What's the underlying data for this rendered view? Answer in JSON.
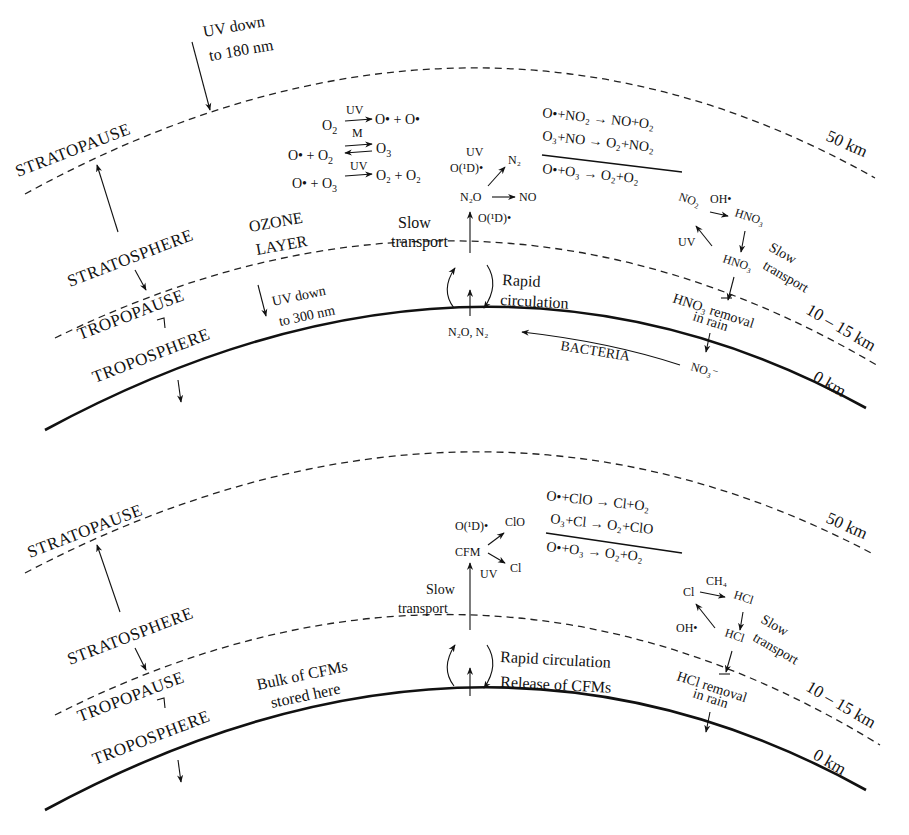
{
  "figure": {
    "panels": [
      {
        "id": "nitrogen-cycle",
        "layers": {
          "stratopause": "STRATOPAUSE",
          "stratosphere": "STRATOSPHERE",
          "tropopause": "TROPOPAUSE",
          "troposphere": "TROPOSPHERE",
          "ozone_layer_1": "OZONE",
          "ozone_layer_2": "LAYER"
        },
        "altitudes": {
          "top": "50 km",
          "mid": "10 – 15 km",
          "ground": "0 km"
        },
        "uv_top_1": "UV down",
        "uv_top_2": "to 180 nm",
        "uv_trop_1": "UV down",
        "uv_trop_2": "to 300 nm",
        "ozone_reactions": {
          "r1_lhs": "O",
          "r1_lhs_sub": "2",
          "r1_cond": "UV",
          "r1_rhs": "O• + O•",
          "r2_cond": "M",
          "r2_lhs": "O• + O",
          "r2_lhs_sub": "2",
          "r2_rhs": "O",
          "r2_rhs_sub": "3",
          "r3_lhs": "O• + O",
          "r3_lhs_sub": "3",
          "r3_cond": "UV",
          "r3_rhs": "O₂ + O₂"
        },
        "n2o_branch": {
          "uv": "UV",
          "o1d_top": "O(¹D)•",
          "n2": "N₂",
          "n2o": "N₂O",
          "no": "NO",
          "o1d_bottom": "O(¹D)•"
        },
        "slow_transport_1": "Slow",
        "slow_transport_2": "transport",
        "rapid_1": "Rapid",
        "rapid_2": "circulation",
        "surface_source": "N₂O, N₂",
        "bacteria": "BACTERIA",
        "nitrate": "NO₃⁻",
        "nox_cycle": {
          "line1": "O•+NO₂ → NO+O₂",
          "line2": "O₃+NO → O₂+NO₂",
          "net": "O•+O₃ → O₂+O₂"
        },
        "sink": {
          "no2": "NO₂",
          "oh": "OH•",
          "hno3_a": "HNO₃",
          "uv": "UV",
          "hno3_b": "HNO₃",
          "slow_1": "Slow",
          "slow_2": "transport",
          "removal_1": "HNO₃ removal",
          "removal_2": "in rain"
        }
      },
      {
        "id": "chlorine-cycle",
        "layers": {
          "stratopause": "STRATOPAUSE",
          "stratosphere": "STRATOSPHERE",
          "tropopause": "TROPOPAUSE",
          "troposphere": "TROPOSPHERE"
        },
        "altitudes": {
          "top": "50 km",
          "mid": "10 – 15 km",
          "ground": "0 km"
        },
        "bulk_1": "Bulk of CFMs",
        "bulk_2": "stored here",
        "cfm_branch": {
          "o1d": "O(¹D)•",
          "clo": "ClO",
          "cfm": "CFM",
          "cl": "Cl",
          "uv": "UV"
        },
        "slow_transport_1": "Slow",
        "slow_transport_2": "transport",
        "rapid": "Rapid circulation",
        "release": "Release of CFMs",
        "clox_cycle": {
          "line1": "O•+ClO → Cl+O₂",
          "line2": "O₃+Cl → O₂+ClO",
          "net": "O•+O₃ → O₂+O₂"
        },
        "sink": {
          "cl": "Cl",
          "ch4": "CH₄",
          "hcl_a": "HCl",
          "oh": "OH•",
          "hcl_b": "HCl",
          "slow_1": "Slow",
          "slow_2": "transport",
          "removal_1": "HCl removal",
          "removal_2": "in rain"
        }
      }
    ]
  }
}
